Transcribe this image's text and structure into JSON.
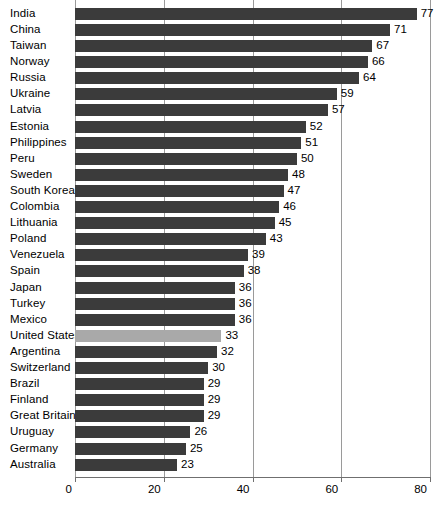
{
  "chart": {
    "title": "",
    "colors": {
      "bar": "#3b3b3b",
      "highlight_bar": "#a9a9a9",
      "gridline": "#9a9a9a",
      "axis": "#6f6f6f",
      "text": "#000000",
      "background": "#ffffff"
    }
  },
  "chart_data": {
    "type": "bar",
    "orientation": "horizontal",
    "title": "",
    "subtitle": "",
    "xlabel": "",
    "ylabel": "",
    "xlim": [
      0,
      80
    ],
    "xticks": [
      "0",
      "20",
      "40",
      "60",
      "80"
    ],
    "xtick_values": [
      0,
      20,
      40,
      60,
      80
    ],
    "grid": true,
    "legend": false,
    "highlight_category": "United States",
    "categories": [
      "India",
      "China",
      "Taiwan",
      "Norway",
      "Russia",
      "Ukraine",
      "Latvia",
      "Estonia",
      "Philippines",
      "Peru",
      "Sweden",
      "South Korea",
      "Colombia",
      "Lithuania",
      "Poland",
      "Venezuela",
      "Spain",
      "Japan",
      "Turkey",
      "Mexico",
      "United States",
      "Argentina",
      "Switzerland",
      "Brazil",
      "Finland",
      "Great Britain",
      "Uruguay",
      "Germany",
      "Australia"
    ],
    "values": [
      77,
      71,
      67,
      66,
      64,
      59,
      57,
      52,
      51,
      50,
      48,
      47,
      46,
      45,
      43,
      39,
      38,
      36,
      36,
      36,
      33,
      32,
      30,
      29,
      29,
      29,
      26,
      25,
      23
    ],
    "bars": [
      {
        "label": "India",
        "value": 77,
        "value_text": "77",
        "highlight": false
      },
      {
        "label": "China",
        "value": 71,
        "value_text": "71",
        "highlight": false
      },
      {
        "label": "Taiwan",
        "value": 67,
        "value_text": "67",
        "highlight": false
      },
      {
        "label": "Norway",
        "value": 66,
        "value_text": "66",
        "highlight": false
      },
      {
        "label": "Russia",
        "value": 64,
        "value_text": "64",
        "highlight": false
      },
      {
        "label": "Ukraine",
        "value": 59,
        "value_text": "59",
        "highlight": false
      },
      {
        "label": "Latvia",
        "value": 57,
        "value_text": "57",
        "highlight": false
      },
      {
        "label": "Estonia",
        "value": 52,
        "value_text": "52",
        "highlight": false
      },
      {
        "label": "Philippines",
        "value": 51,
        "value_text": "51",
        "highlight": false
      },
      {
        "label": "Peru",
        "value": 50,
        "value_text": "50",
        "highlight": false
      },
      {
        "label": "Sweden",
        "value": 48,
        "value_text": "48",
        "highlight": false
      },
      {
        "label": "South Korea",
        "value": 47,
        "value_text": "47",
        "highlight": false
      },
      {
        "label": "Colombia",
        "value": 46,
        "value_text": "46",
        "highlight": false
      },
      {
        "label": "Lithuania",
        "value": 45,
        "value_text": "45",
        "highlight": false
      },
      {
        "label": "Poland",
        "value": 43,
        "value_text": "43",
        "highlight": false
      },
      {
        "label": "Venezuela",
        "value": 39,
        "value_text": "39",
        "highlight": false
      },
      {
        "label": "Spain",
        "value": 38,
        "value_text": "38",
        "highlight": false
      },
      {
        "label": "Japan",
        "value": 36,
        "value_text": "36",
        "highlight": false
      },
      {
        "label": "Turkey",
        "value": 36,
        "value_text": "36",
        "highlight": false
      },
      {
        "label": "Mexico",
        "value": 36,
        "value_text": "36",
        "highlight": false
      },
      {
        "label": "United States",
        "value": 33,
        "value_text": "33",
        "highlight": true
      },
      {
        "label": "Argentina",
        "value": 32,
        "value_text": "32",
        "highlight": false
      },
      {
        "label": "Switzerland",
        "value": 30,
        "value_text": "30",
        "highlight": false
      },
      {
        "label": "Brazil",
        "value": 29,
        "value_text": "29",
        "highlight": false
      },
      {
        "label": "Finland",
        "value": 29,
        "value_text": "29",
        "highlight": false
      },
      {
        "label": "Great Britain",
        "value": 29,
        "value_text": "29",
        "highlight": false
      },
      {
        "label": "Uruguay",
        "value": 26,
        "value_text": "26",
        "highlight": false
      },
      {
        "label": "Germany",
        "value": 25,
        "value_text": "25",
        "highlight": false
      },
      {
        "label": "Australia",
        "value": 23,
        "value_text": "23",
        "highlight": false
      }
    ]
  }
}
